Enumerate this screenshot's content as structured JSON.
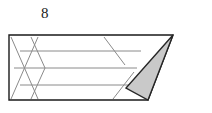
{
  "figure": {
    "title_label": "8",
    "label_position": {
      "x": 41,
      "y": 6
    },
    "canvas": {
      "width": 212,
      "height": 113
    },
    "colors": {
      "outline": "#1a1a1a",
      "hatch": "#8a8a8a",
      "shaded_fill": "#c9c9c9",
      "shaded_stroke": "#262626",
      "background": "#ffffff",
      "label_text": "#1a1a1a"
    },
    "outline_shape": {
      "name": "trapezoid-outline",
      "points": "9,35 173,35 148,100 9,100",
      "stroke_width": 1.4
    },
    "shaded_triangle": {
      "name": "shaded-triangle",
      "points": "173,35 126,88 148,100",
      "stroke_width": 1.4
    },
    "horizontal_hatch_lines": [
      {
        "x1": 20,
        "y1": 51,
        "x2": 141,
        "y2": 51
      },
      {
        "x1": 14,
        "y1": 68,
        "x2": 137,
        "y2": 68
      },
      {
        "x1": 20,
        "y1": 85,
        "x2": 133,
        "y2": 85
      }
    ],
    "diagonal_hatch_lines": [
      {
        "x1": 11,
        "y1": 37,
        "x2": 38,
        "y2": 99
      },
      {
        "x1": 38,
        "y1": 37,
        "x2": 11,
        "y2": 99
      },
      {
        "x1": 31,
        "y1": 37,
        "x2": 45,
        "y2": 68
      },
      {
        "x1": 45,
        "y1": 68,
        "x2": 31,
        "y2": 99
      },
      {
        "x1": 104,
        "y1": 37,
        "x2": 125,
        "y2": 65
      },
      {
        "x1": 113,
        "y1": 99,
        "x2": 134,
        "y2": 72
      }
    ],
    "hatch_stroke_width": 1.0
  }
}
